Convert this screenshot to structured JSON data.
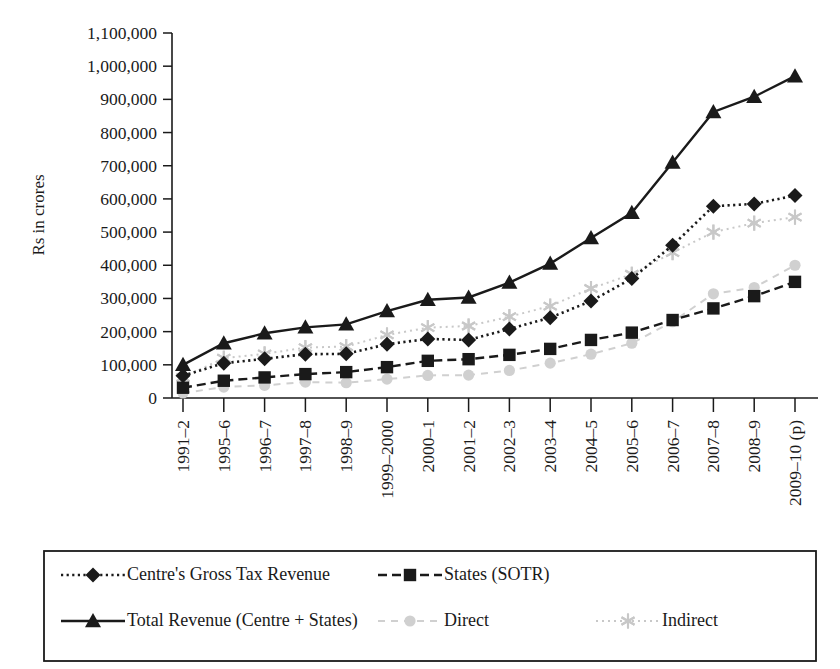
{
  "chart_data": {
    "type": "line",
    "title": "",
    "xlabel": "",
    "ylabel": "Rs in crores",
    "ylim": [
      0,
      1100000
    ],
    "ytick_step": 100000,
    "ytick_labels": [
      "0",
      "100,000",
      "200,000",
      "300,000",
      "400,000",
      "500,000",
      "600,000",
      "700,000",
      "800,000",
      "900,000",
      "1,000,000",
      "1,100,000"
    ],
    "grid": false,
    "legend_position": "bottom",
    "categories": [
      "1991–2",
      "1995–6",
      "1996–7",
      "1997–8",
      "1998–9",
      "1999–2000",
      "2000–1",
      "2001–2",
      "2002–3",
      "2003–4",
      "2004–5",
      "2005–6",
      "2006–7",
      "2007–8",
      "2008–9",
      "2009–10 (p)"
    ],
    "series": [
      {
        "name": "Centre's Gross Tax Revenue",
        "marker": "diamond",
        "linestyle": "dotted",
        "color": "#1a1a1a",
        "values": [
          67000,
          105000,
          118000,
          132000,
          133000,
          162000,
          178000,
          175000,
          208000,
          242000,
          292000,
          360000,
          460000,
          578000,
          585000,
          610000
        ]
      },
      {
        "name": "States (SOTR)",
        "marker": "square",
        "linestyle": "dashed",
        "color": "#1a1a1a",
        "values": [
          31000,
          52000,
          62000,
          72000,
          78000,
          93000,
          112000,
          117000,
          130000,
          148000,
          175000,
          197000,
          235000,
          270000,
          307000,
          350000
        ]
      },
      {
        "name": "Total Revenue (Centre + States)",
        "marker": "triangle",
        "linestyle": "solid",
        "color": "#1a1a1a",
        "values": [
          100000,
          165000,
          195000,
          213000,
          222000,
          262000,
          296000,
          303000,
          348000,
          405000,
          482000,
          558000,
          710000,
          862000,
          908000,
          970000
        ]
      },
      {
        "name": "Direct",
        "marker": "circle",
        "linestyle": "dashed-light",
        "color": "#d0d0d0",
        "values": [
          15000,
          33000,
          38000,
          48000,
          46000,
          57000,
          68000,
          69000,
          83000,
          105000,
          132000,
          165000,
          230000,
          314000,
          333000,
          400000
        ]
      },
      {
        "name": "Indirect",
        "marker": "asterisk",
        "linestyle": "dotted-light",
        "color": "#c8c8c8",
        "values": [
          62000,
          120000,
          133000,
          152000,
          155000,
          190000,
          212000,
          217000,
          245000,
          277000,
          330000,
          373000,
          438000,
          500000,
          527000,
          545000
        ]
      }
    ]
  },
  "axes": {
    "y_axis_label": "Rs in crores"
  },
  "legend": {
    "entries": [
      {
        "label": "Centre's Gross Tax Revenue",
        "marker": "diamond-marker",
        "style": "dotted"
      },
      {
        "label": "States (SOTR)",
        "marker": "square-marker",
        "style": "dashed"
      },
      {
        "label": "Total Revenue (Centre + States)",
        "marker": "triangle-marker",
        "style": "solid"
      },
      {
        "label": "Direct",
        "marker": "circle-marker",
        "style": "dashed-light"
      },
      {
        "label": "Indirect",
        "marker": "asterisk-marker",
        "style": "dotted-light"
      }
    ]
  }
}
